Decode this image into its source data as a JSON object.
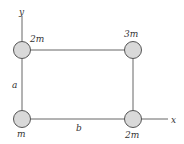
{
  "diagram": {
    "axes": {
      "x_label": "x",
      "y_label": "y"
    },
    "sides": {
      "vertical_label": "a",
      "horizontal_label": "b"
    },
    "masses": [
      {
        "id": "top-left",
        "label": "2m"
      },
      {
        "id": "top-right",
        "label": "3m"
      },
      {
        "id": "bottom-left",
        "label": "m"
      },
      {
        "id": "bottom-right",
        "label": "2m"
      }
    ],
    "colors": {
      "mass_fill": "#d9d9d9",
      "mass_stroke": "#555555",
      "line": "#666666",
      "text": "#333333"
    }
  }
}
